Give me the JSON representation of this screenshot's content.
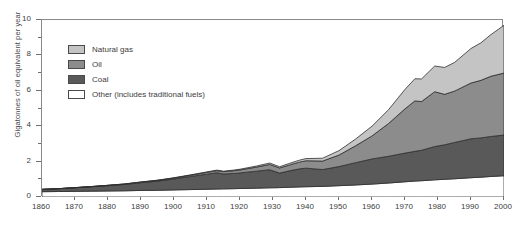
{
  "chart_data": {
    "type": "area",
    "stacked": true,
    "title": "",
    "xlabel": "",
    "ylabel": "Gigatonnes of oil equivalent per year",
    "xlim": [
      1860,
      2000
    ],
    "ylim": [
      0,
      10
    ],
    "grid": false,
    "legend_position": "upper-left-inside",
    "x_ticks": [
      1860,
      1870,
      1880,
      1890,
      1900,
      1910,
      1920,
      1930,
      1940,
      1950,
      1960,
      1970,
      1980,
      1990,
      2000
    ],
    "y_ticks": [
      0,
      2,
      4,
      6,
      8,
      10
    ],
    "y_minor_ticks": [
      1,
      3,
      5,
      7,
      9
    ],
    "x": [
      1860,
      1865,
      1870,
      1875,
      1880,
      1885,
      1890,
      1895,
      1900,
      1905,
      1910,
      1913,
      1915,
      1918,
      1920,
      1925,
      1929,
      1932,
      1935,
      1938,
      1940,
      1945,
      1950,
      1955,
      1960,
      1965,
      1970,
      1973,
      1975,
      1979,
      1982,
      1985,
      1990,
      1993,
      1996,
      2000
    ],
    "stack_order_bottom_to_top": [
      "Other (includes traditional fuels)",
      "Coal",
      "Oil",
      "Natural gas"
    ],
    "series": [
      {
        "name": "Other (includes traditional fuels)",
        "color": "#ffffff",
        "values": [
          0.3,
          0.31,
          0.32,
          0.33,
          0.34,
          0.35,
          0.37,
          0.38,
          0.4,
          0.42,
          0.44,
          0.45,
          0.46,
          0.47,
          0.48,
          0.5,
          0.52,
          0.53,
          0.55,
          0.57,
          0.58,
          0.6,
          0.64,
          0.68,
          0.73,
          0.79,
          0.86,
          0.9,
          0.92,
          0.97,
          1.0,
          1.03,
          1.09,
          1.12,
          1.16,
          1.2
        ]
      },
      {
        "name": "Coal",
        "color": "#595959",
        "values": [
          0.13,
          0.16,
          0.2,
          0.25,
          0.3,
          0.36,
          0.44,
          0.52,
          0.62,
          0.74,
          0.85,
          0.92,
          0.84,
          0.86,
          0.88,
          0.96,
          1.02,
          0.82,
          0.93,
          1.02,
          1.05,
          0.95,
          1.08,
          1.26,
          1.42,
          1.51,
          1.62,
          1.68,
          1.72,
          1.88,
          1.95,
          2.05,
          2.2,
          2.22,
          2.26,
          2.3
        ]
      },
      {
        "name": "Oil",
        "color": "#8c8c8c",
        "values": [
          0.0,
          0.0,
          0.01,
          0.01,
          0.02,
          0.02,
          0.03,
          0.04,
          0.05,
          0.07,
          0.1,
          0.12,
          0.13,
          0.15,
          0.17,
          0.23,
          0.3,
          0.29,
          0.33,
          0.38,
          0.42,
          0.48,
          0.65,
          0.95,
          1.3,
          1.85,
          2.5,
          2.85,
          2.75,
          3.1,
          2.85,
          2.9,
          3.15,
          3.25,
          3.4,
          3.5
        ]
      },
      {
        "name": "Natural gas",
        "color": "#c4c4c4",
        "values": [
          0.0,
          0.0,
          0.0,
          0.0,
          0.0,
          0.01,
          0.01,
          0.01,
          0.02,
          0.02,
          0.03,
          0.03,
          0.03,
          0.04,
          0.04,
          0.06,
          0.08,
          0.07,
          0.09,
          0.11,
          0.12,
          0.16,
          0.25,
          0.38,
          0.55,
          0.78,
          1.1,
          1.25,
          1.28,
          1.45,
          1.52,
          1.62,
          1.95,
          2.12,
          2.35,
          2.7
        ]
      }
    ],
    "totals_year_2000": 9.7
  },
  "axes": {
    "y_label": "Gigatonnes of oil equivalent per year",
    "y_tick_labels": [
      "0",
      "2",
      "4",
      "6",
      "8",
      "10"
    ],
    "x_tick_labels": [
      "1860",
      "1870",
      "1880",
      "1890",
      "1900",
      "1910",
      "1920",
      "1930",
      "1940",
      "1950",
      "1960",
      "1970",
      "1980",
      "1990",
      "2000"
    ]
  },
  "legend": {
    "items": [
      {
        "label": "Natural gas",
        "color": "#c4c4c4"
      },
      {
        "label": "Oil",
        "color": "#8c8c8c"
      },
      {
        "label": "Coal",
        "color": "#595959"
      },
      {
        "label": "Other (includes traditional fuels)",
        "color": "#ffffff"
      }
    ]
  }
}
